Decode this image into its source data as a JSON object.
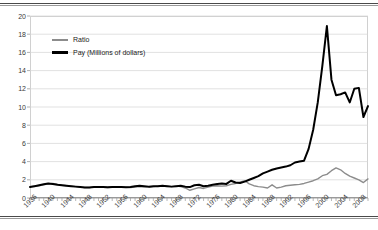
{
  "figure": {
    "background_color": "#ffffff",
    "rule_color": "#4a4a4a"
  },
  "chart_data": {
    "type": "line",
    "title": "",
    "subtitle": "",
    "xlabel": "",
    "ylabel": "",
    "xlim": [
      1936,
      2010
    ],
    "ylim": [
      0,
      20
    ],
    "grid": true,
    "grid_axis": "y",
    "legend_position": "upper-left-inside",
    "y_ticks": [
      0,
      2,
      4,
      6,
      8,
      10,
      12,
      14,
      16,
      18,
      20
    ],
    "y_tick_labels": [
      "0",
      "2",
      "4",
      "6",
      "8",
      "10",
      "12",
      "14",
      "16",
      "18",
      "20"
    ],
    "x_tick_labels": [
      "1936",
      "1940",
      "1944",
      "1948",
      "1952",
      "1956",
      "1960",
      "1964",
      "1968",
      "1972",
      "1976",
      "1980",
      "1984",
      "1988",
      "1992",
      "1996",
      "2000",
      "2004",
      "2008"
    ],
    "x_tick_step_years": 4,
    "x_minor_tick_step_years": 1,
    "x": [
      1936,
      1937,
      1938,
      1939,
      1940,
      1941,
      1942,
      1943,
      1944,
      1945,
      1946,
      1947,
      1948,
      1949,
      1950,
      1951,
      1952,
      1953,
      1954,
      1955,
      1956,
      1957,
      1958,
      1959,
      1960,
      1961,
      1962,
      1963,
      1964,
      1965,
      1966,
      1967,
      1968,
      1969,
      1970,
      1971,
      1972,
      1973,
      1974,
      1975,
      1976,
      1977,
      1978,
      1979,
      1980,
      1981,
      1982,
      1983,
      1984,
      1985,
      1986,
      1987,
      1988,
      1989,
      1990,
      1991,
      1992,
      1993,
      1994,
      1995,
      1996,
      1997,
      1998,
      1999,
      2000,
      2001,
      2002,
      2003,
      2004,
      2005,
      2006,
      2007,
      2008,
      2009,
      2010
    ],
    "series": [
      {
        "name": "Ratio",
        "color": "#8c8c8c",
        "line_width": 1.4,
        "values": [
          1.25,
          1.3,
          1.35,
          1.45,
          1.55,
          1.6,
          1.5,
          1.4,
          1.35,
          1.3,
          1.25,
          1.2,
          1.15,
          1.15,
          1.2,
          1.2,
          1.18,
          1.15,
          1.18,
          1.2,
          1.2,
          1.18,
          1.15,
          1.2,
          1.25,
          1.22,
          1.2,
          1.25,
          1.3,
          1.35,
          1.3,
          1.25,
          1.3,
          1.25,
          1.1,
          0.85,
          1.0,
          1.15,
          1.05,
          1.2,
          1.3,
          1.35,
          1.3,
          1.35,
          1.5,
          1.6,
          1.75,
          1.9,
          1.55,
          1.35,
          1.25,
          1.2,
          1.1,
          1.45,
          1.1,
          1.2,
          1.35,
          1.4,
          1.45,
          1.5,
          1.6,
          1.75,
          1.9,
          2.1,
          2.45,
          2.6,
          3.0,
          3.3,
          3.1,
          2.7,
          2.4,
          2.2,
          2.0,
          1.7,
          2.1
        ]
      },
      {
        "name": "Pay (Millions of dollars)",
        "color": "#000000",
        "line_width": 2.0,
        "values": [
          1.2,
          1.3,
          1.4,
          1.5,
          1.6,
          1.55,
          1.45,
          1.4,
          1.35,
          1.3,
          1.25,
          1.2,
          1.15,
          1.15,
          1.2,
          1.2,
          1.2,
          1.18,
          1.2,
          1.22,
          1.2,
          1.18,
          1.2,
          1.3,
          1.35,
          1.3,
          1.25,
          1.28,
          1.3,
          1.35,
          1.3,
          1.25,
          1.3,
          1.35,
          1.25,
          1.2,
          1.4,
          1.45,
          1.3,
          1.35,
          1.45,
          1.55,
          1.6,
          1.55,
          1.9,
          1.7,
          1.65,
          1.8,
          2.0,
          2.2,
          2.4,
          2.7,
          2.9,
          3.1,
          3.25,
          3.35,
          3.45,
          3.6,
          3.9,
          4.0,
          4.1,
          5.4,
          7.5,
          10.5,
          14.5,
          18.9,
          13.0,
          11.3,
          11.4,
          11.6,
          10.5,
          12.0,
          12.1,
          8.9,
          10.1
        ]
      }
    ]
  },
  "legend": {
    "items": [
      {
        "label": "Ratio",
        "color": "#8c8c8c"
      },
      {
        "label": "Pay (Millions of dollars)",
        "color": "#000000"
      }
    ]
  }
}
